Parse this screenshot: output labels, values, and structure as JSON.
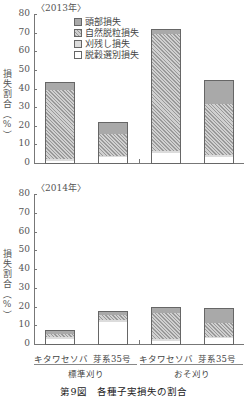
{
  "chart_data": [
    {
      "type": "bar",
      "stacked": true,
      "title": "〈2013年〉",
      "ylabel": "損失割合（%）",
      "ylim": [
        0,
        80
      ],
      "yticks": [
        0,
        10,
        20,
        30,
        40,
        50,
        60,
        70,
        80
      ],
      "categories": [
        "キタワセソバ",
        "芽系35号",
        "キタワセソバ",
        "芽系35号"
      ],
      "groups": [
        "標準刈り",
        "おそ刈り"
      ],
      "series": [
        {
          "name": "脱穀選別損失",
          "values": [
            1.0,
            3.0,
            5.5,
            3.0
          ]
        },
        {
          "name": "刈残し損失",
          "values": [
            1.0,
            1.0,
            1.0,
            1.5
          ]
        },
        {
          "name": "自然脱粒損失",
          "values": [
            37.0,
            11.5,
            62.5,
            27.0
          ]
        },
        {
          "name": "頭部損失",
          "values": [
            4.5,
            6.5,
            3.0,
            13.0
          ]
        }
      ],
      "totals": [
        43.5,
        22.0,
        72.0,
        44.5
      ],
      "legend_position": "upper-left-inside"
    },
    {
      "type": "bar",
      "stacked": true,
      "title": "〈2014年〉",
      "ylabel": "損失割合（%）",
      "ylim": [
        0,
        80
      ],
      "yticks": [
        0,
        10,
        20,
        30,
        40,
        50,
        60,
        70,
        80
      ],
      "categories": [
        "キタワセソバ",
        "芽系35号",
        "キタワセソバ",
        "芽系35号"
      ],
      "groups": [
        "標準刈り",
        "おそ刈り"
      ],
      "series": [
        {
          "name": "脱穀選別損失",
          "values": [
            2.5,
            12.0,
            1.5,
            3.0
          ]
        },
        {
          "name": "刈残し損失",
          "values": [
            1.5,
            1.0,
            1.0,
            1.0
          ]
        },
        {
          "name": "自然脱粒損失",
          "values": [
            1.5,
            2.5,
            14.0,
            7.0
          ]
        },
        {
          "name": "頭部損失",
          "values": [
            2.0,
            2.0,
            3.0,
            8.0
          ]
        }
      ],
      "totals": [
        7.5,
        17.5,
        19.5,
        19.0
      ]
    }
  ],
  "top": {
    "year": "〈2013年〉"
  },
  "bottom": {
    "year": "〈2014年〉"
  },
  "ylabel": "損失割合（%）",
  "yticks": [
    "0",
    "10",
    "20",
    "30",
    "40",
    "50",
    "60",
    "70",
    "80"
  ],
  "legend": [
    "頭部損失",
    "自然脱粒損失",
    "刈残し損失",
    "脱穀選別損失"
  ],
  "xlabels": [
    "キタワセソバ",
    "芽系35号",
    "キタワセソバ",
    "芽系35号"
  ],
  "groups": [
    "標準刈り",
    "おそ刈り"
  ],
  "caption": "第9図　各種子実損失の割合"
}
